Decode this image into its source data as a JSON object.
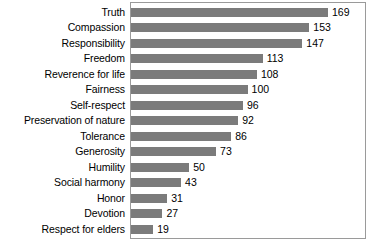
{
  "chart_data": {
    "type": "bar",
    "orientation": "horizontal",
    "title": "",
    "subtitle": "",
    "xlabel": "",
    "ylabel": "",
    "grid": false,
    "legend": null,
    "xlim": [
      0,
      169
    ],
    "axis_visible": false,
    "tick_labels": [],
    "value_labels_shown": true,
    "bar_color": "#7b7b7b",
    "frame_color": "#9a9a9a",
    "background": "#ffffff",
    "categories": [
      "Truth",
      "Compassion",
      "Responsibility",
      "Freedom",
      "Reverence for life",
      "Fairness",
      "Self-respect",
      "Preservation of nature",
      "Tolerance",
      "Generosity",
      "Humility",
      "Social harmony",
      "Honor",
      "Devotion",
      "Respect for elders"
    ],
    "values": [
      169,
      153,
      147,
      113,
      108,
      100,
      96,
      92,
      86,
      73,
      50,
      43,
      31,
      27,
      19
    ],
    "rows": [
      {
        "label": "Truth",
        "value": 169,
        "value_text": "169"
      },
      {
        "label": "Compassion",
        "value": 153,
        "value_text": "153"
      },
      {
        "label": "Responsibility",
        "value": 147,
        "value_text": "147"
      },
      {
        "label": "Freedom",
        "value": 113,
        "value_text": "113"
      },
      {
        "label": "Reverence for life",
        "value": 108,
        "value_text": "108"
      },
      {
        "label": "Fairness",
        "value": 100,
        "value_text": "100"
      },
      {
        "label": "Self-respect",
        "value": 96,
        "value_text": "96"
      },
      {
        "label": "Preservation of nature",
        "value": 92,
        "value_text": "92"
      },
      {
        "label": "Tolerance",
        "value": 86,
        "value_text": "86"
      },
      {
        "label": "Generosity",
        "value": 73,
        "value_text": "73"
      },
      {
        "label": "Humility",
        "value": 50,
        "value_text": "50"
      },
      {
        "label": "Social harmony",
        "value": 43,
        "value_text": "43"
      },
      {
        "label": "Honor",
        "value": 31,
        "value_text": "31"
      },
      {
        "label": "Devotion",
        "value": 27,
        "value_text": "27"
      },
      {
        "label": "Respect for elders",
        "value": 19,
        "value_text": "19"
      }
    ]
  }
}
